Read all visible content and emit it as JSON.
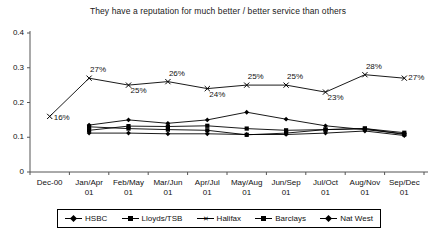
{
  "chart_data": {
    "type": "line",
    "title": "They have a reputation for much better / better service than others",
    "xlabel": "",
    "ylabel": "",
    "ylim": [
      0,
      0.4
    ],
    "yticks": [
      "0",
      "0.1",
      "0.2",
      "0.3",
      "0.4"
    ],
    "ytick_values": [
      0,
      0.1,
      0.2,
      0.3,
      0.4
    ],
    "grid": false,
    "legend_position": "bottom",
    "categories": [
      "Dec-00",
      "Jan/Apr 01",
      "Feb/May 01",
      "Mar/Jun 01",
      "Apr/Jul 01",
      "May/Aug 01",
      "Jun/Sep 01",
      "Jul/Oct 01",
      "Aug/Nov 01",
      "Sep/Dec 01"
    ],
    "series": [
      {
        "name": "HSBC",
        "marker": "diamond",
        "values": [
          null,
          0.135,
          0.15,
          0.14,
          0.15,
          0.172,
          0.152,
          0.133,
          0.122,
          0.11
        ]
      },
      {
        "name": "Lloyds/TSB",
        "marker": "square",
        "values": [
          null,
          0.12,
          0.132,
          0.131,
          0.133,
          0.125,
          0.12,
          0.122,
          0.125,
          0.113
        ]
      },
      {
        "name": "Halifax",
        "marker": "x",
        "values": [
          0.16,
          0.27,
          0.25,
          0.26,
          0.24,
          0.25,
          0.25,
          0.23,
          0.28,
          0.27
        ],
        "labels": [
          "16%",
          "27%",
          "25%",
          "26%",
          "24%",
          "25%",
          "25%",
          "23%",
          "28%",
          "27%"
        ]
      },
      {
        "name": "Barclays",
        "marker": "square",
        "values": [
          null,
          0.13,
          0.125,
          0.122,
          0.12,
          0.107,
          0.112,
          0.122,
          0.125,
          0.108
        ]
      },
      {
        "name": "Nat West",
        "marker": "diamond",
        "values": [
          null,
          0.112,
          0.112,
          0.11,
          0.11,
          0.108,
          0.108,
          0.112,
          0.118,
          0.105
        ]
      }
    ]
  },
  "legend": {
    "items": [
      {
        "label": "HSBC",
        "marker": "diamond"
      },
      {
        "label": "Lloyds/TSB",
        "marker": "square"
      },
      {
        "label": "Halifax",
        "marker": "x"
      },
      {
        "label": "Barclays",
        "marker": "square"
      },
      {
        "label": "Nat West",
        "marker": "diamond"
      }
    ]
  },
  "colors": {
    "line": "#000000",
    "axis": "#555555",
    "text": "#111111",
    "background": "#ffffff"
  }
}
